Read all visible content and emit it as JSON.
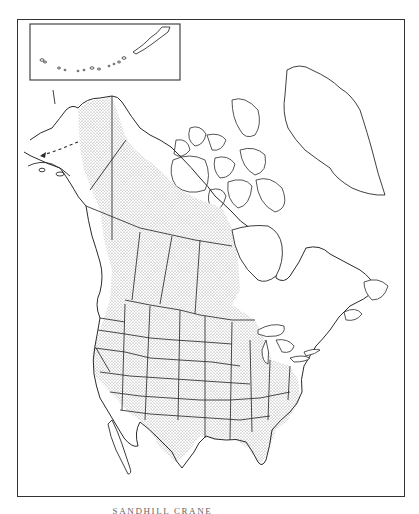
{
  "map": {
    "subject": "Range map of North America",
    "caption": "SANDHILL CRANE",
    "inset": {
      "label": "Aleutian Islands inset"
    },
    "legend": {
      "range_fill": "stippled dots = range",
      "migration_line": "dashed line with arrow = migration route to Siberia"
    },
    "colors": {
      "outline": "#2a2a2a",
      "stipple": "#7a7a7a",
      "background": "#ffffff"
    },
    "regions_shaded": [
      "Western & northern Alaska",
      "Yukon & Northwest Territories (mainland)",
      "British Columbia (interior)",
      "Alberta",
      "Saskatchewan",
      "Manitoba (west)",
      "Western & central United States",
      "Southeastern United States",
      "Florida",
      "Texas"
    ],
    "regions_unshaded": [
      "Arctic islands",
      "Greenland",
      "Hudson Bay / Quebec / Labrador",
      "Northeastern United States",
      "Pacific coast WA/OR",
      "Mexico"
    ]
  }
}
